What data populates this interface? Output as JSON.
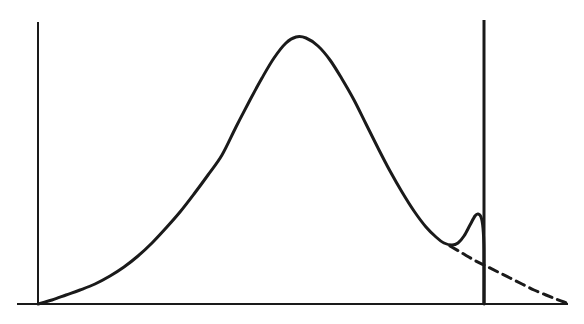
{
  "figure": {
    "title": "",
    "background_color": "#ffffff",
    "width": 584,
    "height": 324,
    "ink_color": "#1a1a1a"
  },
  "chart_data": {
    "type": "line",
    "title": "",
    "subtitle": "",
    "xlabel": "",
    "ylabel": "",
    "grid": false,
    "legend": false,
    "legend_position": "none",
    "xlim": [
      0,
      584
    ],
    "ylim": [
      0,
      324
    ],
    "axes": {
      "y_axis": {
        "label": "y-axis",
        "x": 38,
        "y_top": 22,
        "y_bottom": 304,
        "stroke_width": 2,
        "color": "#1a1a1a"
      },
      "x_axis": {
        "label": "baseline",
        "y": 304,
        "x_left": 17,
        "x_right": 568,
        "stroke_width": 2,
        "color": "#1a1a1a"
      },
      "cutoff_line": {
        "label": "right boundary line",
        "x": 484,
        "y_top": 20,
        "y_bottom": 304,
        "stroke_width": 3,
        "color": "#1a1a1a"
      }
    },
    "series": [
      {
        "name": "main-distribution-curve",
        "style": "solid",
        "stroke_width": 3,
        "color": "#1a1a1a",
        "description": "skewed bell-shaped distribution rising from the origin to a broad maximum, descending to a local minimum, then a small secondary bump terminating at the cutoff line",
        "points": [
          [
            38,
            304
          ],
          [
            52,
            300
          ],
          [
            66,
            295
          ],
          [
            80,
            290
          ],
          [
            95,
            284
          ],
          [
            110,
            276
          ],
          [
            124,
            267
          ],
          [
            138,
            256
          ],
          [
            152,
            243
          ],
          [
            166,
            228
          ],
          [
            180,
            212
          ],
          [
            194,
            194
          ],
          [
            208,
            175
          ],
          [
            222,
            155
          ],
          [
            236,
            127
          ],
          [
            250,
            100
          ],
          [
            262,
            78
          ],
          [
            274,
            58
          ],
          [
            286,
            43
          ],
          [
            296,
            37
          ],
          [
            306,
            38
          ],
          [
            318,
            46
          ],
          [
            330,
            60
          ],
          [
            342,
            79
          ],
          [
            354,
            100
          ],
          [
            366,
            124
          ],
          [
            378,
            148
          ],
          [
            390,
            171
          ],
          [
            402,
            192
          ],
          [
            414,
            211
          ],
          [
            426,
            227
          ],
          [
            436,
            237
          ],
          [
            444,
            243
          ],
          [
            452,
            245
          ],
          [
            458,
            243
          ],
          [
            464,
            236
          ],
          [
            470,
            225
          ],
          [
            475,
            216
          ],
          [
            478,
            214
          ],
          [
            481,
            217
          ],
          [
            483,
            228
          ],
          [
            484,
            250
          ],
          [
            484,
            304
          ]
        ],
        "annotations": {
          "peak": {
            "x": 296,
            "y": 37,
            "label": "global maximum"
          },
          "local_min": {
            "x": 452,
            "y": 245,
            "label": "local minimum"
          },
          "bump_peak": {
            "x": 477,
            "y": 214,
            "label": "secondary bump"
          },
          "origin": {
            "x": 38,
            "y": 304,
            "label": "origin"
          }
        }
      },
      {
        "name": "extrapolated-tail",
        "style": "dashed",
        "dash_pattern": "9 6",
        "stroke_width": 3,
        "color": "#1a1a1a",
        "description": "dashed continuation of the underlying smooth decay beyond the local minimum, asymptotically approaching the baseline",
        "points": [
          [
            450,
            246
          ],
          [
            462,
            253
          ],
          [
            474,
            260
          ],
          [
            486,
            266
          ],
          [
            498,
            272
          ],
          [
            510,
            278
          ],
          [
            522,
            284
          ],
          [
            534,
            290
          ],
          [
            546,
            295
          ],
          [
            556,
            299
          ],
          [
            564,
            302
          ],
          [
            570,
            304
          ]
        ]
      }
    ]
  }
}
